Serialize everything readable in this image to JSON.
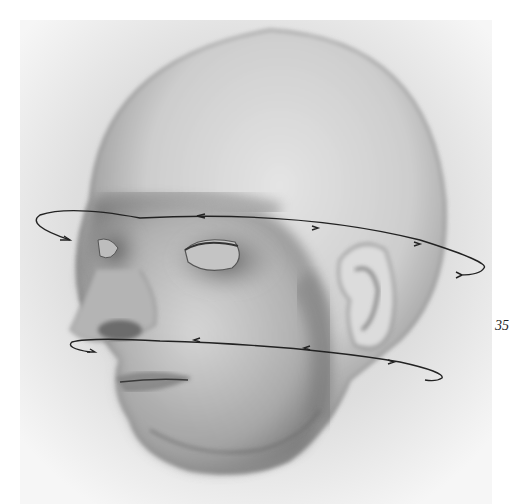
{
  "page": {
    "page_number": "35",
    "figure": {
      "subject": "pencil drawing of a bald male head in three-quarter view",
      "annotations": [
        "rotation-arrow-eye-level",
        "rotation-arrow-mouth-level"
      ]
    }
  }
}
